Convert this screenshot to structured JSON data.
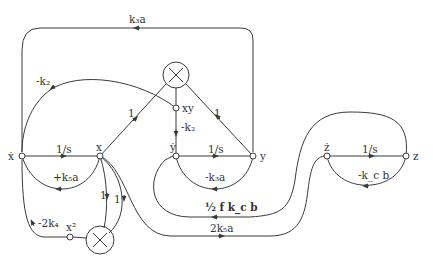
{
  "diagram": {
    "type": "signal-flow-graph",
    "colors": {
      "line": "#3a3a3a",
      "background": "#ffffff"
    },
    "nodes": {
      "xdot": "ẋ",
      "x": "x",
      "xy": "xy",
      "ydot": "ẏ",
      "y": "y",
      "zdot": "ż",
      "z": "z",
      "x2": "x²",
      "multiplier_top": "×",
      "multiplier_bottom": "×"
    },
    "edges": {
      "xdot_to_x": "1/s",
      "x_to_xdot_feedback": "+k₅a",
      "y_to_xdot_top": "k₃a",
      "xy_to_xdot": "-k₂",
      "x_to_mult_top": "1",
      "y_to_mult_top": "1",
      "xy_to_ydot": "-k₂",
      "ydot_to_y": "1/s",
      "y_to_ydot_feedback": "-k₃a",
      "z_to_ydot": "½ f k_c b",
      "x_to_zdot": "2k₅a",
      "zdot_to_z": "1/s",
      "z_to_zdot_feedback": "-k_c b",
      "x_to_mult_bottom_a": "1",
      "x_to_mult_bottom_b": "1",
      "x2_to_xdot": "-2k₄"
    }
  }
}
